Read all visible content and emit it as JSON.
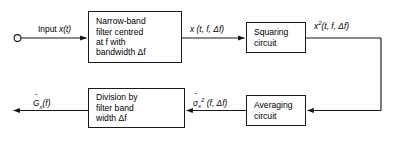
{
  "diagram": {
    "stroke_color": "#1a1a1a",
    "background_color": "#ffffff",
    "blocks": [
      {
        "id": "filter",
        "name": "narrow-band-filter-block",
        "lines": [
          "Narrow-band",
          "filter centred",
          "at f with",
          "bandwidth  Δf"
        ]
      },
      {
        "id": "squaring",
        "name": "squaring-circuit-block",
        "lines": [
          "Squaring",
          "circuit"
        ]
      },
      {
        "id": "division",
        "name": "division-block",
        "lines": [
          "Division by",
          "filter band",
          "width Δf"
        ]
      },
      {
        "id": "averaging",
        "name": "averaging-circuit-block",
        "lines": [
          "Averaging",
          "circuit"
        ]
      }
    ],
    "signal_labels": {
      "input": "Input x(t)",
      "filtered": "x (t, f, Δf)",
      "squared": "x²(t, f, Δf)",
      "variance": "σ̂²x(f, Δf)",
      "output": "Ěx(f)"
    },
    "label_parts": {
      "input_prefix": "Input ",
      "input_var": "x",
      "input_args": "(t)",
      "filtered_var": "x",
      "filtered_args": " (t, f, Δf)",
      "squared_var": "x",
      "squared_exp": "2",
      "squared_args": "(t, f, Δf)",
      "variance_var": "σ",
      "variance_hat": "ˆ",
      "variance_sub": "x",
      "variance_exp": "2",
      "variance_args": " (f, Δf)",
      "output_var": "G",
      "output_hat": "ˆ",
      "output_sub": "x",
      "output_args": "(f)"
    },
    "terminals": {
      "input_node": "open-circle-terminal"
    }
  }
}
